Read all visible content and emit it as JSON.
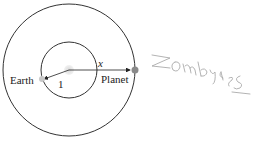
{
  "diagram": {
    "labels": {
      "earth": "Earth",
      "planet": "Planet",
      "earth_radius": "1",
      "planet_radius": "x"
    },
    "annotation": "Zombies",
    "colors": {
      "orbit": "#333333",
      "sun": "#cccccc",
      "earth": "#bbbbbb",
      "planet": "#888888",
      "handwriting": "#aaaaaa"
    }
  }
}
